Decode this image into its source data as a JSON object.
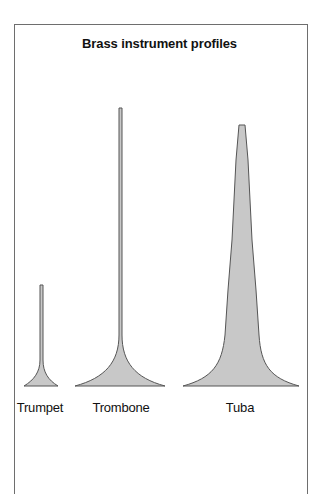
{
  "diagram": {
    "title": "Brass instrument profiles",
    "fill_color": "#c8c8c8",
    "stroke_color": "#555555",
    "instruments": [
      {
        "name": "Trumpet",
        "label_x": 40
      },
      {
        "name": "Trombone",
        "label_x": 121
      },
      {
        "name": "Tuba",
        "label_x": 240
      }
    ]
  }
}
